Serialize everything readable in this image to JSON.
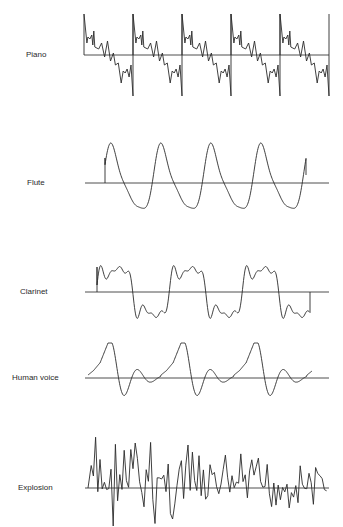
{
  "figure": {
    "panels": [
      {
        "id": "piano",
        "label": "Piano",
        "label_x": 26,
        "label_y": 50,
        "baseline_y": 55,
        "x_start": 84,
        "x_end": 329,
        "shape": "sawtooth-with-ripples",
        "cycles": 5,
        "period_px": 49,
        "top_y": 14,
        "bottom_y": 96
      },
      {
        "id": "flute",
        "label": "Flute",
        "label_x": 27,
        "label_y": 178,
        "baseline_y": 183,
        "x_start": 85,
        "x_end": 329,
        "shape": "near-sine",
        "cycles": 4,
        "period_px": 50,
        "top_y": 138,
        "bottom_y": 213
      },
      {
        "id": "clarinet",
        "label": "Clarinet",
        "label_x": 20,
        "label_y": 287,
        "baseline_y": 292,
        "x_start": 85,
        "x_end": 329,
        "shape": "square-like-with-harmonics",
        "cycles": 3,
        "period_px": 73,
        "top_y": 253,
        "bottom_y": 316
      },
      {
        "id": "human-voice",
        "label": "Human voice",
        "label_x": 12,
        "label_y": 373,
        "baseline_y": 378,
        "x_start": 85,
        "x_end": 329,
        "shape": "pulse-with-decaying-ringing",
        "cycles": 3,
        "period_px": 73,
        "top_y": 340,
        "bottom_y": 398
      },
      {
        "id": "explosion",
        "label": "Explosion",
        "label_x": 18,
        "label_y": 483,
        "baseline_y": 488,
        "x_start": 85,
        "x_end": 329,
        "shape": "random-noise-decaying",
        "top_y": 428,
        "bottom_y": 527
      }
    ],
    "line_color": "#2b2b2b",
    "background": "#ffffff"
  }
}
